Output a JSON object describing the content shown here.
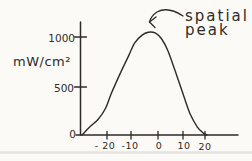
{
  "figure": {
    "background_color": "#fbfaf7",
    "ink_color": "#2e2b27",
    "scan_artifact_color": "#e0ded8",
    "style": "hand-drawn scanned textbook figure"
  },
  "chart_data": {
    "type": "line",
    "title": "",
    "xlabel": "",
    "ylabel": "mW/cm²",
    "x_ticks": [
      -20,
      -10,
      0,
      10,
      20
    ],
    "x_tick_display": [
      "- 20",
      "-10",
      "0",
      "10",
      "20"
    ],
    "y_ticks": [
      0,
      500,
      1000
    ],
    "y_tick_display": [
      "0",
      "500",
      "1000"
    ],
    "xlim": [
      -31,
      33
    ],
    "ylim": [
      0,
      1150
    ],
    "grid": false,
    "legend": false,
    "annotation": {
      "text": "spatial peak",
      "lines": [
        "spatial",
        "peak"
      ],
      "arrow_icon": "curved-arrow-pointing-down-left-at-peak"
    },
    "series": [
      {
        "name": "spatial intensity profile",
        "x": [
          -31,
          -28,
          -24.5,
          -21.5,
          -19,
          -15.5,
          -12,
          -9.5,
          -6.5,
          -4,
          -1,
          1.5,
          4,
          7,
          10,
          13,
          16,
          18.5,
          20
        ],
        "y": [
          0,
          80,
          160,
          270,
          430,
          630,
          815,
          950,
          1030,
          1060,
          1050,
          990,
          870,
          660,
          440,
          225,
          85,
          20,
          0
        ]
      }
    ]
  }
}
